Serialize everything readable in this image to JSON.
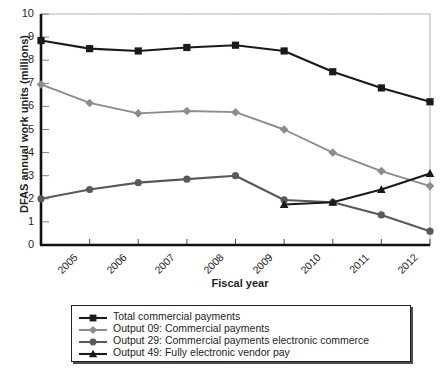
{
  "chart_data": {
    "type": "line",
    "title": "",
    "xlabel": "Fiscal year",
    "ylabel": "DFAS annual work units (millions)",
    "categories": [
      "2005",
      "2006",
      "2007",
      "2008",
      "2009",
      "2010",
      "2011",
      "2012",
      "2013"
    ],
    "x": [
      2005,
      2006,
      2007,
      2008,
      2009,
      2010,
      2011,
      2012,
      2013
    ],
    "xlim": [
      2005,
      2013
    ],
    "ylim": [
      0,
      10
    ],
    "yticks": [
      0,
      1,
      2,
      3,
      4,
      5,
      6,
      7,
      8,
      9,
      10
    ],
    "ytick_labels": [
      "0",
      "1",
      "2",
      "3",
      "4",
      "5",
      "6",
      "7",
      "8",
      "9",
      "10"
    ],
    "grid": false,
    "legend_position": "below-center",
    "series": [
      {
        "name": "Total commercial payments",
        "marker": "square",
        "color": "#1a1a1a",
        "values": [
          8.85,
          8.5,
          8.4,
          8.55,
          8.65,
          8.4,
          7.5,
          6.8,
          6.2
        ]
      },
      {
        "name": "Output 09: Commercial payments",
        "marker": "diamond",
        "color": "#8c8c8c",
        "values": [
          6.95,
          6.15,
          5.7,
          5.8,
          5.75,
          5.0,
          4.0,
          3.2,
          2.55
        ]
      },
      {
        "name": "Output 29: Commercial payments electronic commerce",
        "marker": "circle",
        "color": "#595959",
        "values": [
          2.0,
          2.4,
          2.7,
          2.85,
          3.0,
          1.95,
          1.85,
          1.3,
          0.6
        ]
      },
      {
        "name": "Output 49: Fully electronic vendor pay",
        "marker": "triangle",
        "color": "#1a1a1a",
        "values": [
          null,
          null,
          null,
          null,
          null,
          1.75,
          1.85,
          2.4,
          3.1
        ]
      }
    ]
  },
  "legend": {
    "items": [
      {
        "label": "Total commercial payments",
        "marker": "square",
        "color": "#1a1a1a"
      },
      {
        "label": "Output 09: Commercial payments",
        "marker": "diamond",
        "color": "#8c8c8c"
      },
      {
        "label": "Output 29: Commercial payments electronic commerce",
        "marker": "circle",
        "color": "#595959"
      },
      {
        "label": "Output 49: Fully electronic vendor pay",
        "marker": "triangle",
        "color": "#1a1a1a"
      }
    ]
  }
}
